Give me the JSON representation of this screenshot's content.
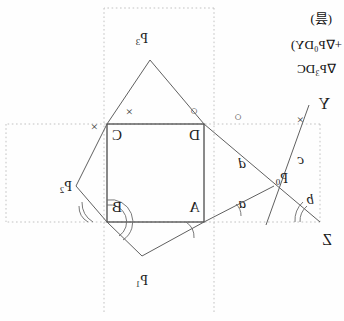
{
  "figure": {
    "title_marker": "(昙)",
    "caption_lines": [
      "+∇P₀DY)",
      "∇P₃DC"
    ],
    "caption_line_1": "+∇P₀DY)",
    "caption_line_2": "∇P₃DC",
    "orientation_note": "mirrored",
    "square": {
      "vertices": [
        {
          "id": "A",
          "label": "A",
          "x": 140,
          "y": 222
        },
        {
          "id": "B",
          "label": "B",
          "x": 237,
          "y": 222
        },
        {
          "id": "C",
          "label": "C",
          "x": 237,
          "y": 124
        },
        {
          "id": "D",
          "label": "D",
          "x": 140,
          "y": 124
        }
      ],
      "label_A": "A",
      "label_B": "B",
      "label_C": "C",
      "label_D": "D"
    },
    "outer_points": [
      {
        "id": "P0",
        "label": "P",
        "sub": "0",
        "x": 62,
        "y": 186
      },
      {
        "id": "P1",
        "label": "P",
        "sub": "1",
        "x": 201,
        "y": 263
      },
      {
        "id": "P2",
        "label": "P",
        "sub": "2",
        "x": 272,
        "y": 190
      },
      {
        "id": "P3",
        "label": "P",
        "sub": "3",
        "x": 194,
        "y": 49
      }
    ],
    "label_P0": "P",
    "label_P0_sub": "0",
    "label_P1": "P",
    "label_P1_sub": "1",
    "label_P2": "P",
    "label_P2_sub": "2",
    "label_P3": "P",
    "label_P3_sub": "3",
    "axis_points": {
      "Y": "Y",
      "Z": "Z"
    },
    "side_labels": {
      "a": "a",
      "b": "b",
      "c": "c",
      "d": "d"
    },
    "angle_marks": {
      "cross": "×",
      "circle": "○"
    },
    "mark_cross_1": "×",
    "mark_cross_2": "×",
    "mark_cross_3": "×",
    "mark_circle_1": "○",
    "mark_circle_2": "○",
    "colors": {
      "stroke": "#555555",
      "square_stroke": "#444444",
      "dotted": "#bbbbbb",
      "text": "#1a1a1a",
      "background": "#fefefe"
    }
  }
}
